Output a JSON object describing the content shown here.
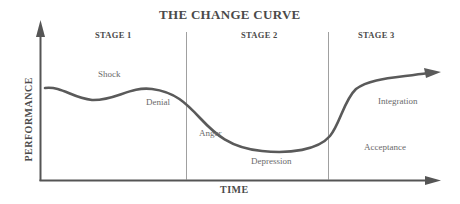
{
  "title": "THE CHANGE CURVE",
  "axes": {
    "x_label": "TIME",
    "y_label": "PERFORMANCE"
  },
  "stages": [
    {
      "label": "STAGE 1"
    },
    {
      "label": "STAGE 2"
    },
    {
      "label": "STAGE 3"
    }
  ],
  "phases": [
    {
      "label": "Shock"
    },
    {
      "label": "Denial"
    },
    {
      "label": "Anger"
    },
    {
      "label": "Depression"
    },
    {
      "label": "Acceptance"
    },
    {
      "label": "Integration"
    }
  ],
  "colors": {
    "curve": "#5a5a5a",
    "axis": "#555555",
    "divider": "#777777",
    "text": "#4a4a4a"
  }
}
